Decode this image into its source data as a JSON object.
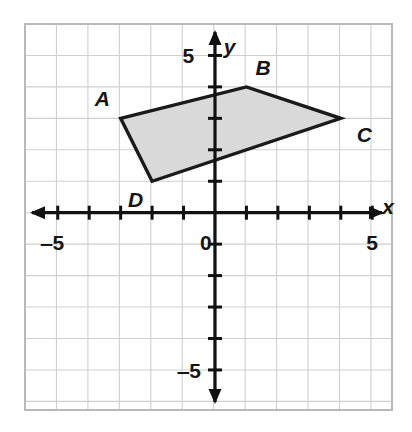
{
  "figure": {
    "type": "coordinate-plane-quadrilateral",
    "background_color": "#ffffff",
    "grid_color": "#cfcfcf",
    "grid_border_color": "#b9b9b9",
    "axis_color": "#111111",
    "shape_stroke_color": "#1a1a1a",
    "shape_fill_color": "#d9d9d9"
  },
  "axes": {
    "x_axis_label": "x",
    "y_axis_label": "y",
    "origin_label": "0",
    "x_ticks": [
      {
        "value": -5,
        "label": "‒5"
      },
      {
        "value": 5,
        "label": "5"
      }
    ],
    "y_ticks": [
      {
        "value": 5,
        "label": "5"
      },
      {
        "value": -5,
        "label": "‒5"
      }
    ],
    "x_range": [
      -6,
      5.6
    ],
    "y_range": [
      -6.3,
      6
    ]
  },
  "chart_data": {
    "type": "scatter",
    "title": "",
    "xlabel": "x",
    "ylabel": "y",
    "xlim": [
      -6,
      5.6
    ],
    "ylim": [
      -6.3,
      6
    ],
    "grid": true,
    "legend": "none",
    "annotations": [
      "A",
      "B",
      "C",
      "D",
      "0",
      "5",
      "‒5"
    ],
    "series": [
      {
        "name": "Quadrilateral ABCD",
        "vertices": [
          {
            "label": "A",
            "x": -3,
            "y": 3,
            "label_dx": -26,
            "label_dy": -30
          },
          {
            "label": "B",
            "x": 1,
            "y": 4,
            "label_dx": 9,
            "label_dy": -30
          },
          {
            "label": "C",
            "x": 4,
            "y": 3,
            "label_dx": 16,
            "label_dy": 6
          },
          {
            "label": "D",
            "x": -2,
            "y": 1,
            "label_dx": -24,
            "label_dy": 8
          }
        ],
        "closed": true,
        "filled": true
      }
    ]
  }
}
